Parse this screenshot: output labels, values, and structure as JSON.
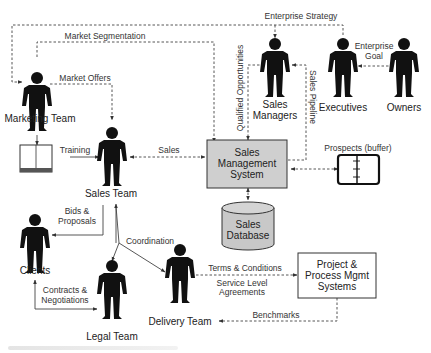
{
  "diagram": {
    "nodes": {
      "marketing_team": {
        "label": "Marketing Team"
      },
      "sales_managers": {
        "label": [
          "Sales",
          "Managers"
        ]
      },
      "executives": {
        "label": "Executives"
      },
      "owners": {
        "label": "Owners"
      },
      "sales_team": {
        "label": "Sales Team"
      },
      "clients": {
        "label": "Clients"
      },
      "legal_team": {
        "label": "Legal Team"
      },
      "delivery_team": {
        "label": "Delivery Team"
      },
      "sales_mgmt_system": {
        "label": [
          "Sales",
          "Management",
          "System"
        ]
      },
      "sales_database": {
        "label": [
          "Sales",
          "Database"
        ]
      },
      "prospects": {
        "label": "Prospects (buffer)"
      },
      "project_mgmt": {
        "label": [
          "Project &",
          "Process Mgmt",
          "Systems"
        ]
      }
    },
    "edges": {
      "enterprise_strategy": "Enterprise Strategy",
      "market_segmentation": "Market Segmentation",
      "market_offers": "Market Offers",
      "enterprise_goal": [
        "Enterprise",
        "Goal"
      ],
      "qualified_opportunities": "Qualified Opportunities",
      "sales_pipeline": "Sales Pipeline",
      "training": "Training",
      "sales": "Sales",
      "bids_proposals": [
        "Bids &",
        "Proposals"
      ],
      "coordination": "Coordination",
      "contracts_negotiations": [
        "Contracts &",
        "Negotiations"
      ],
      "terms_conditions": "Terms & Conditions",
      "service_level": [
        "Service Level",
        "Agreements"
      ],
      "benchmarks": "Benchmarks"
    },
    "colors": {
      "figure": "#111111",
      "system_box_fill": "#cfcfcf",
      "database_fill": "#c8c8c8",
      "line": "#444444"
    }
  }
}
